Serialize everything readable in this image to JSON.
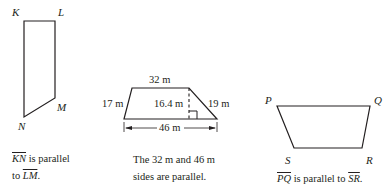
{
  "figures": [
    {
      "id": "KLMN",
      "vertices": {
        "K": "K",
        "L": "L",
        "M": "M",
        "N": "N"
      },
      "caption": {
        "seg1": "KN",
        "middle": " is parallel",
        "line2_prefix": "to ",
        "seg2": "LM",
        "end": "."
      }
    },
    {
      "id": "trapezoid",
      "measurements": {
        "top": "32 m",
        "left": "17 m",
        "height": "16.4 m",
        "right": "19 m",
        "bottom": "46 m"
      },
      "caption": {
        "line1": "The 32 m and 46 m",
        "line2": "sides are parallel."
      }
    },
    {
      "id": "PQRS",
      "vertices": {
        "P": "P",
        "Q": "Q",
        "R": "R",
        "S": "S"
      },
      "caption": {
        "seg1": "PQ",
        "middle": " is parallel to ",
        "seg2": "SR",
        "end": "."
      }
    }
  ],
  "colors": {
    "stroke": "#231f20",
    "background": "#ffffff"
  }
}
